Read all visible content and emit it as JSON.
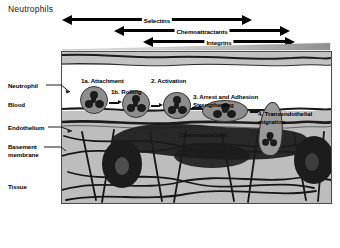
{
  "figure": {
    "title": "Neutrophils",
    "frame_bg": "#c9c9c9",
    "cell_color": "#8d8d8d",
    "nucleus_color": "#1b1b1b"
  },
  "legend_arrows": [
    {
      "label": "Selectins",
      "direction": "double"
    },
    {
      "label": "Chemoattractants",
      "direction": "double"
    },
    {
      "label": "Integrins",
      "direction": "double"
    }
  ],
  "side_labels": [
    {
      "name": "neutrophil",
      "line1": "Neutrophil",
      "line2": ""
    },
    {
      "name": "blood",
      "line1": "Blood",
      "line2": ""
    },
    {
      "name": "endothelium",
      "line1": "Endothelium",
      "line2": ""
    },
    {
      "name": "basement-membrane",
      "line1": "Basement",
      "line2": "membrane"
    },
    {
      "name": "tissue",
      "line1": "Tissue",
      "line2": ""
    }
  ],
  "steps": [
    {
      "id": "1a",
      "line1": "1a. Attachment",
      "line2": ""
    },
    {
      "id": "1b",
      "line1": "1b. Rolling",
      "line2": ""
    },
    {
      "id": "2",
      "line1": "2. Activation",
      "line2": ""
    },
    {
      "id": "3",
      "line1": "3. Arrest and Adhesion",
      "line2": "Strengthening"
    },
    {
      "id": "4",
      "line1": "4. Transendothelial",
      "line2": "migration"
    }
  ],
  "annotations": {
    "chemoattractant": "Chemoattractant"
  }
}
